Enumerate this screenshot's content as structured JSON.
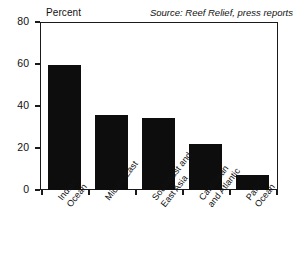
{
  "chart_data": {
    "type": "bar",
    "title": "",
    "subtitle": "",
    "xlabel": "",
    "ylabel": "Percent",
    "ylim": [
      0,
      80
    ],
    "yticks": [
      0,
      20,
      40,
      60,
      80
    ],
    "grid": false,
    "legend": false,
    "orientation": "vertical",
    "bar_color": "#0d0d0d",
    "categories": [
      "Indian Ocean",
      "Middle East",
      "Southeast and East Asia",
      "Caribbean and Atlantic",
      "Paficic Ocean"
    ],
    "category_lines": [
      [
        "Indian",
        "Ocean"
      ],
      [
        "Middle East"
      ],
      [
        "Southeast and",
        "East Asia"
      ],
      [
        "Caribbean",
        "and Atlantic"
      ],
      [
        "Paficic",
        "Ocean"
      ]
    ],
    "values": [
      59.5,
      35.5,
      34.5,
      22,
      7
    ],
    "annotations": [
      {
        "name": "source-note",
        "text": "Source: Reef Relief, press reports",
        "position": "top-right",
        "style": "italic"
      }
    ]
  },
  "axis": {
    "y_title": "Percent",
    "tick_labels": [
      "80",
      "60",
      "40",
      "20",
      "0"
    ]
  },
  "source": {
    "text": "Source: Reef Relief, press reports"
  }
}
